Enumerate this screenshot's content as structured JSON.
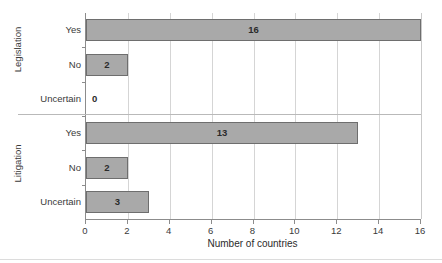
{
  "chart_data": {
    "type": "bar",
    "orientation": "horizontal",
    "title": "",
    "subtitle": "",
    "xlabel": "Number of countries",
    "ylabel": "",
    "xlim": [
      0,
      16
    ],
    "xticks": [
      0,
      2,
      4,
      6,
      8,
      10,
      12,
      14,
      16
    ],
    "xtick_labels": [
      "0",
      "2",
      "4",
      "6",
      "8",
      "10",
      "12",
      "14",
      "16"
    ],
    "grid": "vertical",
    "legend": "none",
    "bar_color": "#a9a9a9",
    "bar_edge_color": "#6e6e6e",
    "grid_color": "#d5d5d5",
    "axis_color": "#8c8c8c",
    "groups": [
      {
        "name": "Legislation",
        "categories": [
          "Yes",
          "No",
          "Uncertain"
        ],
        "values": [
          16,
          2,
          0
        ],
        "value_labels": [
          "16",
          "2",
          "0"
        ]
      },
      {
        "name": "Litigation",
        "categories": [
          "Yes",
          "No",
          "Uncertain"
        ],
        "values": [
          13,
          2,
          3
        ],
        "value_labels": [
          "13",
          "2",
          "3"
        ]
      }
    ],
    "all_bars": [
      {
        "group": "Legislation",
        "category": "Yes",
        "value": 16,
        "label": "16"
      },
      {
        "group": "Legislation",
        "category": "No",
        "value": 2,
        "label": "2"
      },
      {
        "group": "Legislation",
        "category": "Uncertain",
        "value": 0,
        "label": "0"
      },
      {
        "group": "Litigation",
        "category": "Yes",
        "value": 13,
        "label": "13"
      },
      {
        "group": "Litigation",
        "category": "No",
        "value": 2,
        "label": "2"
      },
      {
        "group": "Litigation",
        "category": "Uncertain",
        "value": 3,
        "label": "3"
      }
    ]
  }
}
